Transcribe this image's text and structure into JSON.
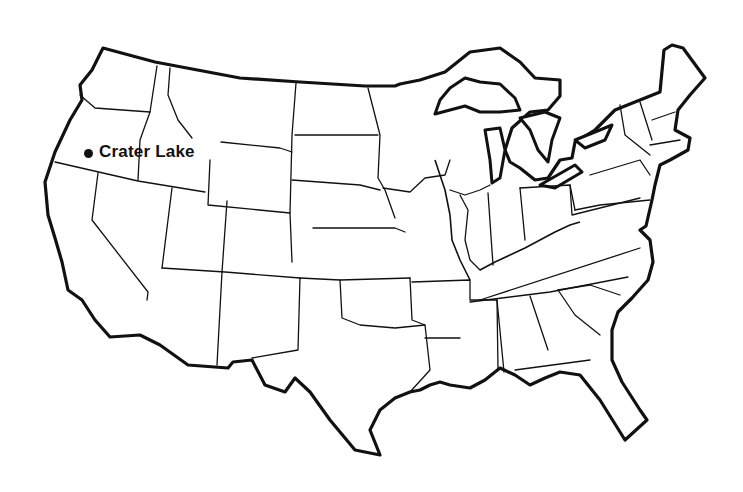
{
  "map": {
    "type": "outline-map",
    "region": "Contiguous United States",
    "style": "black state outlines on white background",
    "colors": {
      "background": "#ffffff",
      "lines": "#111111"
    },
    "markers": [
      {
        "label": "Crater Lake",
        "icon": "filled-circle",
        "x": 88,
        "y": 153
      }
    ]
  }
}
